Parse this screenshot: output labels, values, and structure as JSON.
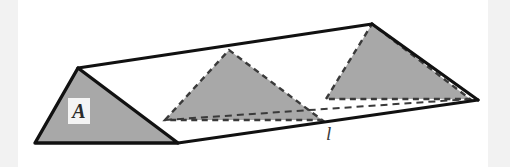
{
  "figure": {
    "background_color": "#ffffff",
    "edge_strip_color": "#f2f2f2",
    "canvas": {
      "width": 510,
      "height": 167
    },
    "colors": {
      "fill_gray": "#a8a8a8",
      "stroke_solid": "#111111",
      "stroke_dashed": "#3a3a3a",
      "label_text": "#2b2b2b",
      "label_box": "#f4f4f4"
    },
    "labels": {
      "cross_section": "A",
      "axis_line": "l"
    },
    "shapes": {
      "prism_outline": {
        "name": "prism-outline",
        "points": "35,143 78,68 372,24 478,100 178,143",
        "stroke": "solid"
      },
      "triangle_a": {
        "name": "triangle-a",
        "points": "35,143 78,68 178,143",
        "fill": "gray",
        "stroke": "solid"
      },
      "triangle_middle": {
        "name": "triangle-middle",
        "points": "165,120 229,50 322,120",
        "fill": "gray",
        "stroke": "dashed"
      },
      "triangle_right": {
        "name": "triangle-right",
        "points": "326,99 372,24 470,99",
        "fill": "gray",
        "stroke": "dashed"
      },
      "hidden_back_edge": {
        "name": "hidden-back-edge",
        "points": "165,120 470,99",
        "stroke": "dashed"
      },
      "top_ridge_edge": {
        "name": "top-ridge-edge",
        "points": "78,68 372,24",
        "stroke": "solid"
      },
      "front_bottom_edge": {
        "name": "front-bottom-edge",
        "points": "178,143 478,100",
        "stroke": "solid"
      },
      "left_front_edge": {
        "name": "left-front-edge",
        "points": "35,143 178,143",
        "stroke": "solid"
      },
      "right_end_edge": {
        "name": "right-end-edge",
        "points": "372,24 478,100",
        "stroke": "solid"
      }
    }
  }
}
